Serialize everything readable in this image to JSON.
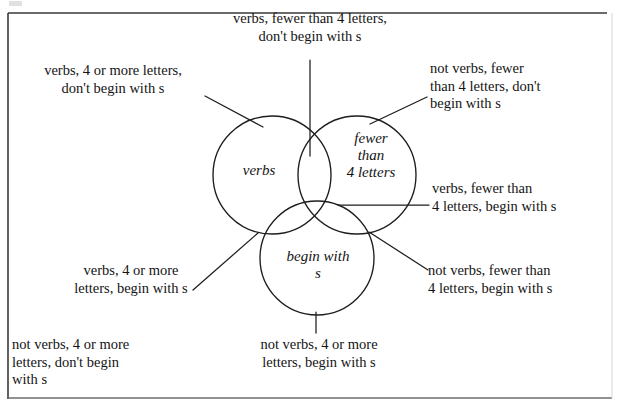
{
  "figure": {
    "type": "venn-3-set",
    "border": {
      "color": "#2b2b2b",
      "style": "rectangle-frame"
    },
    "sets": [
      {
        "id": "verbs",
        "label": "verbs",
        "cx": 272,
        "cy": 175,
        "r": 59
      },
      {
        "id": "fewer-than-4",
        "label": "fewer\nthan\n4 letters",
        "cx": 357,
        "cy": 175,
        "r": 59
      },
      {
        "id": "begin-with-s",
        "label": "begin with\ns",
        "cx": 317,
        "cy": 258,
        "r": 57
      }
    ],
    "region_labels": {
      "top": "verbs, fewer than 4 letters,\ndon't begin with s",
      "top_left": "verbs, 4 or more letters,\ndon't begin with s",
      "top_right": "not verbs, fewer\nthan 4 letters, don't\nbegin with s",
      "right_middle": "verbs, fewer than\n4 letters, begin with s",
      "right_lower": "not verbs, fewer than\n4 letters, begin with s",
      "left_middle": "verbs, 4 or more\nletters, begin with s",
      "bottom_left": "not verbs, 4 or more\nletters, don't begin\nwith s",
      "bottom_middle": "not verbs, 4 or more\nletters, begin with s"
    },
    "set_labels": {
      "verbs": "verbs",
      "fewer_than_4_letters": "fewer\nthan\n4 letters",
      "begin_with_s": "begin with\ns"
    },
    "leader_lines": [
      {
        "name": "leader-top",
        "from": [
          310,
          60
        ],
        "to": [
          310,
          155
        ]
      },
      {
        "name": "leader-top-left",
        "from": [
          206,
          97
        ],
        "to": [
          262,
          126
        ]
      },
      {
        "name": "leader-top-right",
        "from": [
          425,
          97
        ],
        "to": [
          371,
          124
        ]
      },
      {
        "name": "leader-right-middle",
        "from": [
          428,
          205
        ],
        "to": [
          340,
          205
        ]
      },
      {
        "name": "leader-right-lower",
        "from": [
          427,
          268
        ],
        "to": [
          370,
          233
        ]
      },
      {
        "name": "leader-left-middle",
        "from": [
          195,
          288
        ],
        "to": [
          258,
          233
        ]
      },
      {
        "name": "leader-bottom-middle",
        "from": [
          316,
          332
        ],
        "to": [
          316,
          313
        ]
      }
    ],
    "colors": {
      "stroke": "#1d1d1d",
      "background": "#ffffff",
      "text": "#141414"
    }
  }
}
